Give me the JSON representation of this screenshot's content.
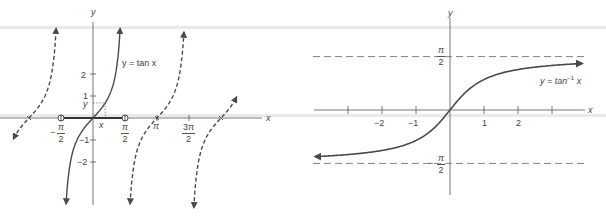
{
  "figure": {
    "left_panel": {
      "title_label": "y = tan x",
      "axis_labels": {
        "x": "x",
        "y": "y"
      },
      "y_ticks": [
        {
          "value": 2,
          "label": "2"
        },
        {
          "value": 1,
          "label": "1"
        },
        {
          "value": -1,
          "label": "−1"
        },
        {
          "value": -2,
          "label": "−2"
        }
      ],
      "x_ticks": [
        {
          "value": "-π/2",
          "num": "π",
          "den": "2",
          "sign": "−"
        },
        {
          "value": "π/2",
          "num": "π",
          "den": "2",
          "sign": ""
        },
        {
          "value": "π",
          "label": "π"
        },
        {
          "value": "3π/2",
          "num": "3π",
          "den": "2",
          "sign": ""
        }
      ],
      "point_labels": {
        "x": "x",
        "y": "y"
      },
      "restricted_domain": "(-π/2, π/2) highlighted with open endpoints",
      "branches": [
        {
          "center": "-π",
          "style": "dashed"
        },
        {
          "center": "0",
          "style": "solid"
        },
        {
          "center": "π",
          "style": "dashed"
        },
        {
          "center": "2π",
          "style": "dashed"
        }
      ]
    },
    "right_panel": {
      "title_label_prefix": "y = tan",
      "title_label_sup": "−1",
      "title_label_suffix": "x",
      "axis_labels": {
        "x": "x",
        "y": "y"
      },
      "x_ticks": [
        {
          "value": -3,
          "label": ""
        },
        {
          "value": -2,
          "label": "−2"
        },
        {
          "value": -1,
          "label": "−1"
        },
        {
          "value": 1,
          "label": "1"
        },
        {
          "value": 2,
          "label": "2"
        },
        {
          "value": 3,
          "label": ""
        }
      ],
      "asymptotes": [
        {
          "value": "π/2",
          "num": "π",
          "den": "2",
          "sign": ""
        },
        {
          "value": "-π/2",
          "num": "π",
          "den": "2",
          "sign": "−"
        }
      ]
    },
    "colors": {
      "curve": "#4a4a4a",
      "axis": "#555555",
      "dashed": "#666666",
      "text": "#444444",
      "scanline": "#e9e9e9"
    }
  },
  "chart_data": [
    {
      "type": "line",
      "title": "y = tan x",
      "xlabel": "x",
      "ylabel": "y",
      "x_tick_labels": [
        "−π/2",
        "π/2",
        "π",
        "3π/2"
      ],
      "y_tick_labels": [
        "2",
        "1",
        "−1",
        "−2"
      ],
      "series": [
        {
          "name": "tan x, principal branch (−π/2, π/2)",
          "style": "solid",
          "x_range": [
            -1.5708,
            1.5708
          ]
        },
        {
          "name": "tan x, branch about −π",
          "style": "dashed"
        },
        {
          "name": "tan x, branch about π",
          "style": "dashed"
        },
        {
          "name": "tan x, branch about 2π",
          "style": "dashed"
        }
      ],
      "grid": false
    },
    {
      "type": "line",
      "title": "y = tan⁻¹ x",
      "xlabel": "x",
      "ylabel": "y",
      "x_tick_labels": [
        "−2",
        "−1",
        "1",
        "2"
      ],
      "y_tick_labels": [
        "π/2",
        "−π/2"
      ],
      "series": [
        {
          "name": "arctan x",
          "style": "solid",
          "x_range": [
            -4,
            3.9
          ]
        }
      ],
      "asymptotes_y": [
        1.5708,
        -1.5708
      ],
      "ylim": [
        -1.5708,
        1.5708
      ],
      "grid": false
    }
  ]
}
